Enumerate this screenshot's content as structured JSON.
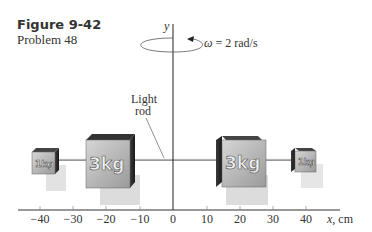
{
  "figure": {
    "title": "Figure 9-42",
    "subtitle": "Problem 48"
  },
  "axes": {
    "y_label": "y",
    "x_label": "x, cm",
    "x_ticks": [
      "−40",
      "−30",
      "−20",
      "−10",
      "0",
      "10",
      "20",
      "30",
      "40"
    ]
  },
  "rotation": {
    "label": "ω = 2 rad/s"
  },
  "rod_label": {
    "line1": "Light",
    "line2": "rod"
  },
  "masses": [
    {
      "label": "1kg",
      "x_cm": -40
    },
    {
      "label": "3kg",
      "x_cm": -20
    },
    {
      "label": "3kg",
      "x_cm": 20
    },
    {
      "label": "1kg",
      "x_cm": 40
    }
  ]
}
